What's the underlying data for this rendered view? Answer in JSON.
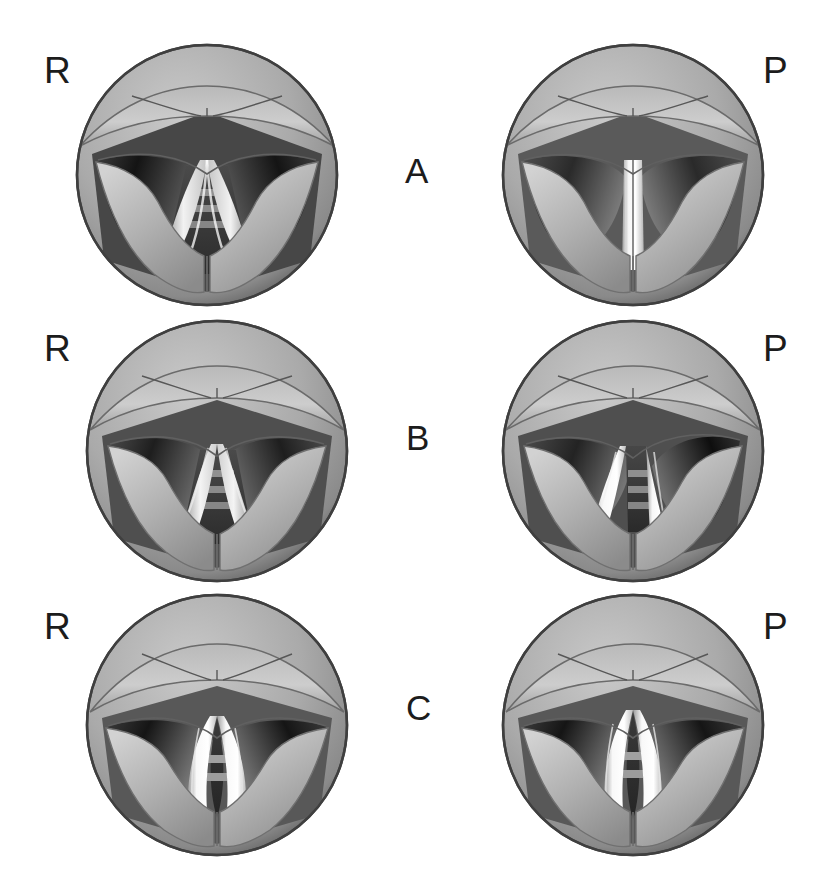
{
  "figure": {
    "type": "medical-illustration",
    "background_color": "#ffffff",
    "text_color": "#1c1c1c",
    "grid": {
      "rows": 3,
      "columns": 2
    }
  },
  "palette": {
    "rim_dark": "#4a4a4a",
    "mucosa_light": "#cfcfcf",
    "mucosa_mid": "#a8a8a8",
    "mucosa_shadow": "#7d7d7d",
    "airway_dark": "#2b2b2b",
    "airway_black": "#101010",
    "cord_white": "#f4f4f4",
    "tracheal_ring": "#8e8e8e",
    "outline": "#3c3c3c"
  },
  "row_labels": [
    {
      "id": "A",
      "label": "A"
    },
    {
      "id": "B",
      "label": "B"
    },
    {
      "id": "C",
      "label": "C"
    }
  ],
  "column_labels": {
    "left": "R",
    "right": "P"
  },
  "panels": [
    {
      "id": "A-left",
      "row": "A",
      "side_label": "R",
      "description": "wide triangular glottic opening, symmetric, vocal cords abducted",
      "glottis_width": 46,
      "glottis_shape": "triangular-wide",
      "deviation": "none",
      "tracheal_rings": 3
    },
    {
      "id": "A-right",
      "row": "A",
      "side_label": "P",
      "description": "narrow vertical slit glottis, cords adducted, bright midline cords",
      "glottis_width": 10,
      "glottis_shape": "slit",
      "deviation": "none",
      "tracheal_rings": 0
    },
    {
      "id": "B-left",
      "row": "B",
      "side_label": "R",
      "description": "moderately open triangular glottis, symmetric",
      "glottis_width": 38,
      "glottis_shape": "triangular-narrow",
      "deviation": "none",
      "tracheal_rings": 3
    },
    {
      "id": "B-right",
      "row": "B",
      "side_label": "P",
      "description": "asymmetric glottis deviated toward the right, one cord displaced",
      "glottis_width": 20,
      "glottis_shape": "asymmetric",
      "deviation": "right",
      "tracheal_rings": 3
    },
    {
      "id": "C-left",
      "row": "C",
      "side_label": "R",
      "description": "narrow elliptical glottic chink, cords nearly closed",
      "glottis_width": 18,
      "glottis_shape": "ellipse-narrow",
      "deviation": "none",
      "tracheal_rings": 2
    },
    {
      "id": "C-right",
      "row": "C",
      "side_label": "P",
      "description": "narrow elliptical glottic chink, cords nearly closed",
      "glottis_width": 18,
      "glottis_shape": "ellipse-narrow",
      "deviation": "none",
      "tracheal_rings": 2
    }
  ]
}
